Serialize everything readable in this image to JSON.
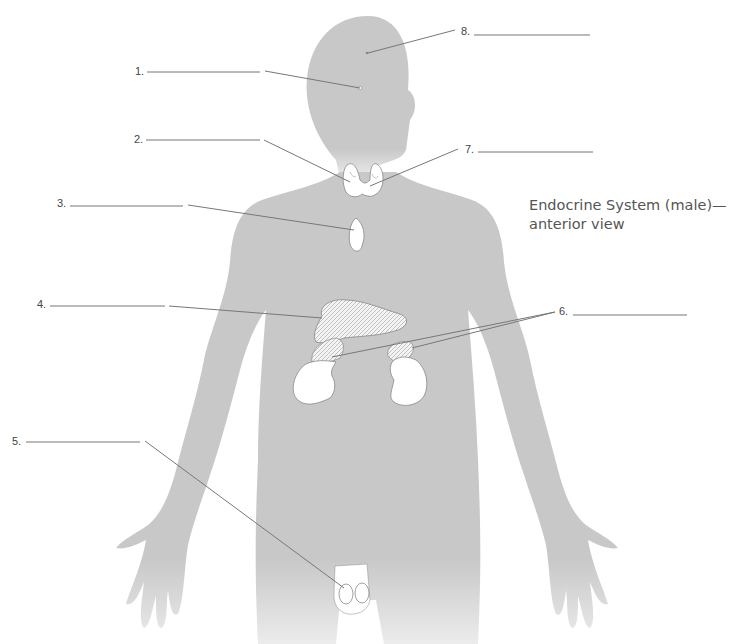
{
  "title": {
    "line1": "Endocrine System (male)—",
    "line2": "anterior view"
  },
  "labels": [
    {
      "number": "1.",
      "blank": "",
      "x": 135,
      "y": 65
    },
    {
      "number": "2.",
      "blank": "",
      "x": 135,
      "y": 134
    },
    {
      "number": "3.",
      "blank": "",
      "x": 57,
      "y": 198
    },
    {
      "number": "4.",
      "blank": "",
      "x": 37,
      "y": 298
    },
    {
      "number": "5.",
      "blank": "",
      "x": 12,
      "y": 436
    },
    {
      "number": "6.",
      "blank": "",
      "x": 559,
      "y": 305
    },
    {
      "number": "7.",
      "blank": "",
      "x": 465,
      "y": 143
    },
    {
      "number": "8.",
      "blank": "",
      "x": 461,
      "y": 25
    }
  ],
  "structures": [
    "pituitary-gland",
    "thyroid-gland",
    "thymus",
    "pancreas",
    "testes",
    "adrenal-glands",
    "parathyroid-glands",
    "pineal-gland"
  ],
  "colors": {
    "silhouette": "#c8c8c8",
    "leader": "#777777",
    "organ_fill": "#ffffff",
    "organ_stroke": "#888888",
    "text": "#444444"
  }
}
